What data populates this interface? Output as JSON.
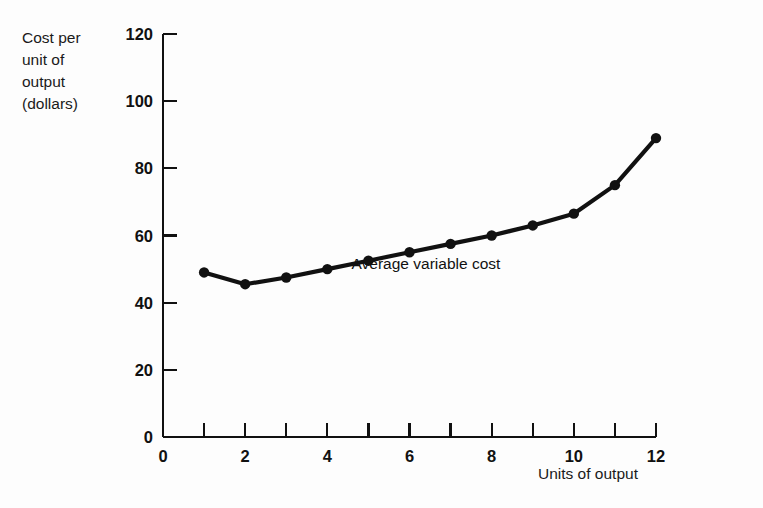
{
  "figure": {
    "background_color": "#fdfdfd",
    "ink_color": "#111111"
  },
  "y_axis_title": {
    "line1": "Cost per",
    "line2": "unit of",
    "line3": "output",
    "line4": "(dollars)"
  },
  "x_axis_title": "Units of output",
  "chart_data": {
    "type": "line",
    "title": "",
    "subtitle": "",
    "xlabel": "Units of output",
    "ylabel": "Cost per unit of output (dollars)",
    "xlim": [
      0,
      12
    ],
    "ylim": [
      0,
      120
    ],
    "grid": false,
    "legend_position": "inline-annotation",
    "x_ticks": [
      0,
      1,
      2,
      3,
      4,
      5,
      6,
      7,
      8,
      9,
      10,
      11,
      12
    ],
    "x_tick_labels": [
      "0",
      "",
      "2",
      "",
      "4",
      "",
      "6",
      "",
      "8",
      "",
      "10",
      "",
      "12"
    ],
    "y_ticks": [
      0,
      20,
      40,
      60,
      80,
      100,
      120
    ],
    "y_tick_labels": [
      "0",
      "20",
      "40",
      "60",
      "80",
      "100",
      "120"
    ],
    "markers": true,
    "marker_style": "filled-circle",
    "annotations": [
      {
        "text": "Average variable cost",
        "x": 6.4,
        "y": 50
      }
    ],
    "series": [
      {
        "name": "Average variable cost",
        "color": "#111111",
        "x": [
          1,
          2,
          3,
          4,
          5,
          6,
          7,
          8,
          9,
          10,
          11,
          12
        ],
        "values": [
          49,
          45.5,
          47.5,
          50,
          52.5,
          55,
          57.5,
          60,
          63,
          66.5,
          75,
          89
        ]
      }
    ]
  }
}
